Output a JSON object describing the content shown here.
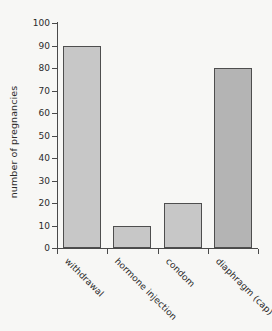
{
  "chart_data": {
    "type": "bar",
    "title": "",
    "subtitle": "",
    "xlabel": "",
    "ylabel": "number of pregnancies",
    "categories": [
      "withdrawal",
      "hormone injection",
      "condom",
      "diaphragm (cap)"
    ],
    "values": [
      90,
      10,
      20,
      80
    ],
    "series": [
      {
        "name": "number of pregnancies",
        "values": [
          90,
          10,
          20,
          80
        ]
      }
    ],
    "ylim": [
      0,
      100
    ],
    "y_ticks": [
      0,
      10,
      20,
      30,
      40,
      50,
      60,
      70,
      80,
      90,
      100
    ],
    "y_tick_labels": [
      "0",
      "10",
      "20",
      "30",
      "40",
      "50",
      "60",
      "70",
      "80",
      "90",
      "100"
    ],
    "grid": false,
    "legend": false,
    "legend_position": "none",
    "bar_colors": [
      "#c7c7c7",
      "#c7c7c7",
      "#c7c7c7",
      "#b4b4b4"
    ],
    "bar_edge_color": "#4e4e4e",
    "axis_color": "#4a4a4a",
    "text_color": "#2b2b2b",
    "background_color": "#f7f7f5"
  }
}
